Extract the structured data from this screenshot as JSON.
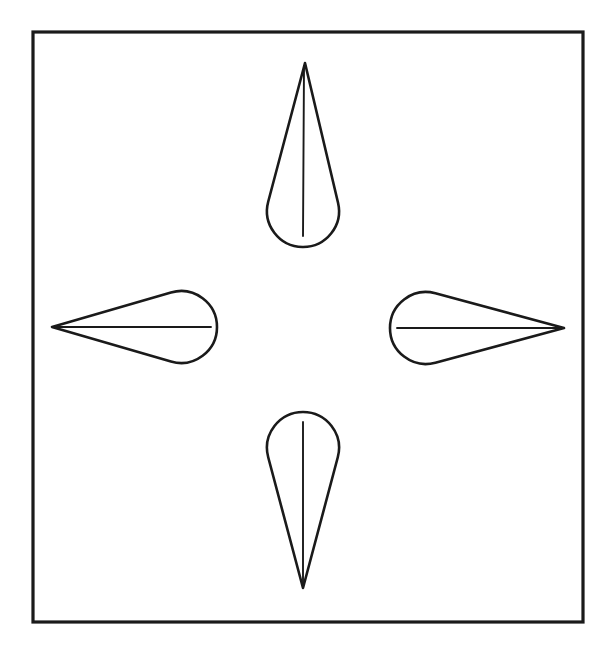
{
  "figure": {
    "canvas": {
      "width": 613,
      "height": 651
    },
    "background_color": "#ffffff",
    "stroke_color": "#1a1a1a",
    "frame": {
      "name": "border-rectangle",
      "x": 33,
      "y": 32,
      "width": 550,
      "height": 590,
      "stroke_width": 3.2,
      "stroke_color": "#1a1a1a"
    },
    "center": {
      "x": 307,
      "y": 327
    },
    "lobe_stroke_width": 2.6,
    "axis_stroke_width": 1.9,
    "lobes": [
      {
        "name": "lobe-up",
        "direction": "up",
        "tip": {
          "x": 305,
          "y": 63
        },
        "round_end_center": {
          "x": 303,
          "y": 211
        },
        "round_end_radius": 36,
        "axis_from": {
          "x": 304,
          "y": 66
        },
        "axis_to": {
          "x": 303,
          "y": 236
        },
        "length": 185,
        "max_width": 72
      },
      {
        "name": "lobe-down",
        "direction": "down",
        "tip": {
          "x": 303,
          "y": 588
        },
        "round_end_center": {
          "x": 303,
          "y": 448
        },
        "round_end_radius": 36,
        "axis_from": {
          "x": 303,
          "y": 422
        },
        "axis_to": {
          "x": 303,
          "y": 585
        },
        "length": 176,
        "max_width": 72
      },
      {
        "name": "lobe-left",
        "direction": "left",
        "tip": {
          "x": 52,
          "y": 327
        },
        "round_end_center": {
          "x": 181,
          "y": 327
        },
        "round_end_radius": 36,
        "axis_from": {
          "x": 55,
          "y": 327
        },
        "axis_to": {
          "x": 211,
          "y": 327
        },
        "length": 165,
        "max_width": 72
      },
      {
        "name": "lobe-right",
        "direction": "right",
        "tip": {
          "x": 564,
          "y": 328
        },
        "round_end_center": {
          "x": 426,
          "y": 328
        },
        "round_end_radius": 36,
        "axis_from": {
          "x": 397,
          "y": 328
        },
        "axis_to": {
          "x": 561,
          "y": 328
        },
        "length": 174,
        "max_width": 72
      }
    ]
  },
  "chart_data": {
    "type": "scatter",
    "subtitle": "",
    "xlabel": "",
    "ylabel": "",
    "grid": false,
    "legend": "none",
    "xlim": [
      33,
      583
    ],
    "ylim": [
      32,
      622
    ],
    "annotations": [],
    "series": [
      {
        "name": "lobe-up",
        "orientation_degrees": 90,
        "tip_x": 305,
        "tip_y": 63,
        "base_center_x": 303,
        "base_center_y": 211,
        "base_radius": 36,
        "length": 185
      },
      {
        "name": "lobe-right",
        "orientation_degrees": 0,
        "tip_x": 564,
        "tip_y": 328,
        "base_center_x": 426,
        "base_center_y": 328,
        "base_radius": 36,
        "length": 174
      },
      {
        "name": "lobe-down",
        "orientation_degrees": 270,
        "tip_x": 303,
        "tip_y": 588,
        "base_center_x": 303,
        "base_center_y": 448,
        "base_radius": 36,
        "length": 176
      },
      {
        "name": "lobe-left",
        "orientation_degrees": 180,
        "tip_x": 52,
        "tip_y": 327,
        "base_center_x": 181,
        "base_center_y": 327,
        "base_radius": 36,
        "length": 165
      }
    ]
  }
}
